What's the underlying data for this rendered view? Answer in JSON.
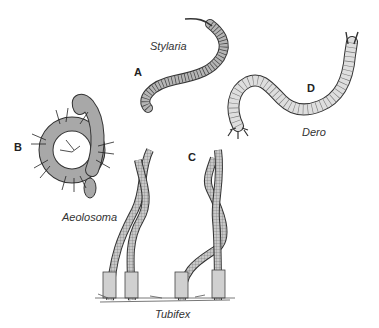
{
  "figure": {
    "panels": [
      {
        "letter": "A",
        "species": "Stylaria"
      },
      {
        "letter": "B",
        "species": "Aeolosoma"
      },
      {
        "letter": "C",
        "species": "Tubifex"
      },
      {
        "letter": "D",
        "species": "Dero"
      }
    ]
  },
  "colors": {
    "background": "#ffffff",
    "body_fill": "#b8b8b8",
    "body_light": "#d8d8d8",
    "outline": "#333333",
    "setae": "#222222"
  }
}
